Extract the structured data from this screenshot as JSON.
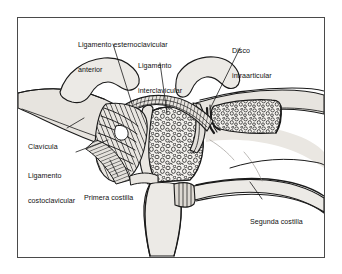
{
  "figure": {
    "language": "es",
    "type": "anatomical-line-drawing",
    "view": "anterior, con corte frontal",
    "frame": {
      "stroke": "#4a4a4a"
    },
    "colors": {
      "background": "#ffffff",
      "outline": "#1a1a1a",
      "bone_fill": "#eceae6",
      "bone_fill_shaded": "#dedbd5",
      "cartilage_fill": "#e6e3de",
      "trabecular_fill": "#f2f0ec",
      "trabecular_stroke": "#2b2b2b",
      "ligament_fiber": "#1a1a1a",
      "leader_line": "#1a1a1a",
      "text": "#111111"
    },
    "labels": [
      {
        "id": "ligamento-esternoclavicular-anterior",
        "lines": [
          "Ligamento esternoclavicular",
          "anterior"
        ],
        "x": 78,
        "y": 24,
        "align": "left",
        "leader": [
          [
            113,
            44
          ],
          [
            132,
            104
          ]
        ]
      },
      {
        "id": "ligamento-interclavicular",
        "lines": [
          "Ligamento",
          "interclavicular"
        ],
        "x": 138,
        "y": 45,
        "align": "left",
        "leader": [
          [
            160,
            63
          ],
          [
            167,
            113
          ]
        ]
      },
      {
        "id": "disco-intraarticular",
        "lines": [
          "Disco",
          "intraarticular"
        ],
        "x": 232,
        "y": 30,
        "align": "left",
        "leader": [
          [
            240,
            48
          ],
          [
            210,
            109
          ]
        ]
      },
      {
        "id": "clavicula",
        "lines": [
          "Clavícula"
        ],
        "x": 28,
        "y": 126,
        "align": "left",
        "leader": [
          [
            67,
            128
          ],
          [
            84,
            118
          ]
        ]
      },
      {
        "id": "ligamento-costoclavicular",
        "lines": [
          "Ligamento",
          "costoclavicular"
        ],
        "x": 28,
        "y": 155,
        "align": "left",
        "leader": [
          [
            76,
            152
          ],
          [
            108,
            140
          ]
        ]
      },
      {
        "id": "primera-costilla",
        "lines": [
          "Primera costilla"
        ],
        "x": 84,
        "y": 177,
        "align": "left",
        "leader": [
          [
            118,
            176
          ],
          [
            110,
            160
          ]
        ]
      },
      {
        "id": "segunda-costilla",
        "lines": [
          "Segunda costilla"
        ],
        "x": 250,
        "y": 201,
        "align": "left",
        "leader": [
          [
            262,
            199
          ],
          [
            250,
            182
          ]
        ]
      }
    ],
    "structures": [
      {
        "id": "clavicula-izquierda",
        "label": "Clavícula izquierda",
        "render": "contorno"
      },
      {
        "id": "clavicula-derecha-seccionada",
        "label": "Clavícula derecha seccionada",
        "render": "hueso esponjoso"
      },
      {
        "id": "manubrio-esternal",
        "label": "Manubrio del esternón",
        "render": "hueso esponjoso"
      },
      {
        "id": "cuerpo-esternal",
        "label": "Cuerpo del esternón",
        "render": "contorno"
      },
      {
        "id": "disco-articular",
        "label": "Disco articular",
        "render": "contorno"
      },
      {
        "id": "ligamento-interclavicular-estructura",
        "label": "Ligamento interclavicular",
        "render": "fibras"
      },
      {
        "id": "ligamento-esternoclavicular-anterior-estructura",
        "label": "Ligamento esternoclavicular anterior",
        "render": "fibras estriadas"
      },
      {
        "id": "ligamento-costoclavicular-estructura",
        "label": "Ligamento costoclavicular",
        "render": "fibras estriadas"
      },
      {
        "id": "primera-costilla-estructura",
        "label": "Primera costilla",
        "render": "contorno"
      },
      {
        "id": "segunda-costilla-estructura",
        "label": "Segunda costilla",
        "render": "contorno"
      }
    ]
  }
}
